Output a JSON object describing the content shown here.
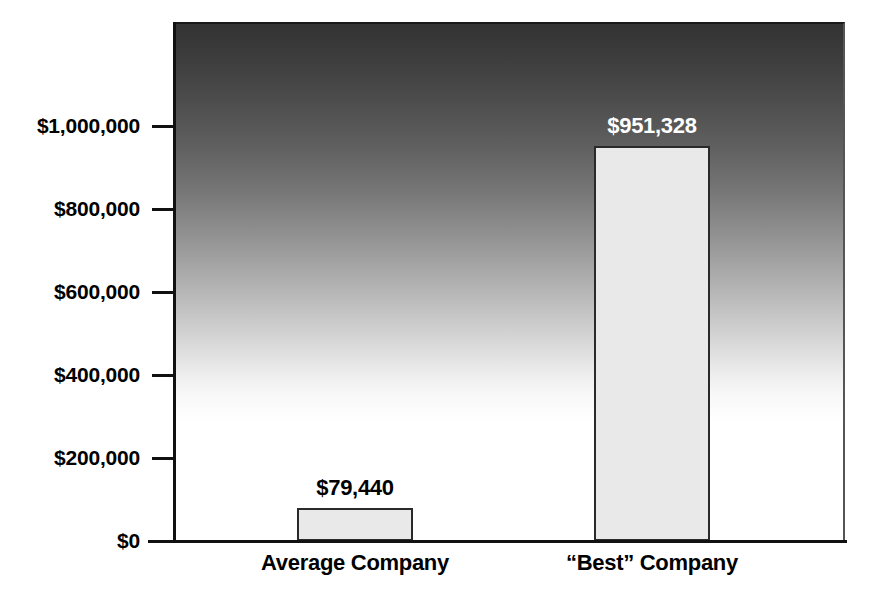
{
  "chart_data": {
    "type": "bar",
    "title": "",
    "subtitle": "",
    "xlabel": "",
    "ylabel": "",
    "categories": [
      "Average Company",
      "“Best” Company"
    ],
    "values": [
      79440,
      951328
    ],
    "value_labels": [
      "$79,440",
      "$951,328"
    ],
    "ylim": [
      0,
      1100000
    ],
    "yticks": [
      0,
      200000,
      400000,
      600000,
      800000,
      1000000
    ],
    "ytick_labels": [
      "$0",
      "$200,000",
      "$400,000",
      "$600,000",
      "$800,000",
      "$1,000,000"
    ],
    "grid": false,
    "legend": null,
    "legend_position": "none",
    "annotations": [],
    "colors": {
      "bar_fill": "#e9e9e9",
      "bar_border": "#2a2a2a",
      "plot_gradient_top": "#333333",
      "plot_gradient_bottom": "#ffffff",
      "axis": "#111111",
      "value_label_dark": "#000000",
      "value_label_light": "#ffffff",
      "page_background": "#ffffff"
    }
  }
}
